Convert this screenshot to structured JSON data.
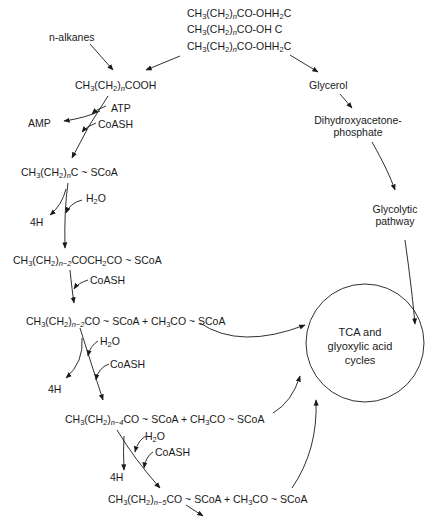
{
  "diagram": {
    "triglyceride": {
      "line1_prefix": "CH",
      "line1": "CH3(CH2)nCO-OH2C",
      "line2": "CH3(CH2)nCO-OH C",
      "line3": "CH3(CH2)nCO-OH2C"
    },
    "nodes": {
      "n_alkanes": "n-alkanes",
      "fatty_acid": "CH3(CH2)nCOOH",
      "atp": "ATP",
      "amp": "AMP",
      "coash_1": "CoASH",
      "acyl_coa": "CH3(CH2)nC ~ SCoA",
      "h2o_1": "H2O",
      "fourh_1": "4H",
      "ketoacyl_coa": "CH3(CH2)n−2COCH2CO ~ SCoA",
      "coash_2": "CoASH",
      "step1_products": "CH3(CH2)n−2CO ~ SCoA + CH3CO ~ SCoA",
      "h2o_2": "H2O",
      "coash_3": "CoASH",
      "fourh_2": "4H",
      "step2_products": "CH3(CH2)n−4CO ~ SCoA + CH3CO ~ SCoA",
      "h2o_3": "H2O",
      "coash_4": "CoASH",
      "fourh_3": "4H",
      "step3_products": "CH3(CH2)n−5CO ~ SCoA + CH3CO ~ SCoA",
      "glycerol": "Glycerol",
      "dhap_line1": "Dihydroxyacetone-",
      "dhap_line2": "phosphate",
      "glycolytic_line1": "Glycolytic",
      "glycolytic_line2": "pathway",
      "cycle_line1": "TCA and",
      "cycle_line2": "glyoxylic acid",
      "cycle_line3": "cycles"
    },
    "text_parts": {
      "CH": "CH",
      "3": "3",
      "2": "2",
      "n": "n",
      "nm2": "n−2",
      "nm4": "n−4",
      "nm5": "n−5",
      "paren_open": "(CH",
      "paren_close": ")",
      "co_oh2c": "CO-OH",
      "c": "C",
      "co_oh_c": "CO-OH  C",
      "cooh": "COOH",
      "c_scoa": "C ~ SCoA",
      "cochco": "COCH",
      "co_scoa": "CO ~ SCoA",
      "plus_acetyl": " + CH",
      "h2o_h": "H",
      "h2o_o": "O"
    },
    "colors": {
      "line": "#1a1a1a",
      "background": "#ffffff"
    }
  }
}
